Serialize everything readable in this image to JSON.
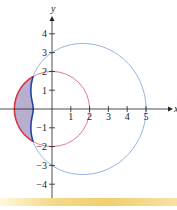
{
  "chart_data": {
    "type": "line",
    "title": "",
    "xlabel": "x",
    "ylabel": "y",
    "xlim": [
      -2,
      5.5
    ],
    "ylim": [
      -4.5,
      4.5
    ],
    "x_ticks": [
      "1",
      "2",
      "3",
      "4",
      "5"
    ],
    "y_ticks": [
      "4",
      "3",
      "2",
      "1",
      "−1",
      "−2",
      "−3",
      "−4"
    ],
    "series": [
      {
        "name": "circle r = 2",
        "equation": "r = 2",
        "color": "#e07a8a"
      },
      {
        "name": "limacon r = 3 + 2cos(theta)",
        "equation": "r = 3 + 2cos(θ)",
        "color": "#8fb0e0"
      }
    ],
    "shaded_region": {
      "description": "inside r = 2, outside r = 3 + 2cos(θ)",
      "fill": "#b7aed0",
      "boundary_inner": "#1d3fa8",
      "boundary_outer": "#d8323f"
    },
    "grid": false
  },
  "axes": {
    "x_label": "x",
    "y_label": "y"
  }
}
